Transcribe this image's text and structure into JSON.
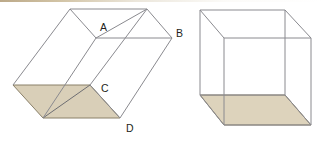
{
  "figure": {
    "background_color": "#ffffff",
    "edge_color": "#6e6e72",
    "shaded_face_color": "#d9cfb8",
    "shaded_face_stroke": "#8a8069",
    "label_color": "#231f20",
    "top_strip_color": "#b09a74"
  },
  "left_solid": {
    "name": "oblique-prism",
    "shaded_base_label": "shaded base parallelogram",
    "labels": [
      {
        "id": "A",
        "text": "A",
        "x": 100,
        "y": 31
      },
      {
        "id": "B",
        "text": "B",
        "x": 176,
        "y": 37
      },
      {
        "id": "C",
        "text": "C",
        "x": 101,
        "y": 92
      },
      {
        "id": "D",
        "text": "D",
        "x": 126,
        "y": 132
      }
    ],
    "geometry": {
      "top_back_left": [
        70,
        9
      ],
      "top_back_right": [
        147,
        9
      ],
      "top_front_right": [
        172,
        38
      ],
      "top_front_left": [
        96,
        38
      ],
      "bottom_back_left": [
        13,
        85
      ],
      "bottom_back_right": [
        90,
        85
      ],
      "bottom_front_right": [
        120,
        118
      ],
      "bottom_front_left": [
        43,
        118
      ]
    }
  },
  "right_solid": {
    "name": "right-cube",
    "shaded_base_label": "shaded base square",
    "geometry": {
      "top_back_left": [
        200,
        10
      ],
      "top_back_right": [
        285,
        10
      ],
      "top_front_right": [
        311,
        38
      ],
      "top_front_left": [
        224,
        38
      ],
      "bottom_back_left": [
        200,
        95
      ],
      "bottom_back_right": [
        285,
        95
      ],
      "bottom_front_right": [
        311,
        125
      ],
      "bottom_front_left": [
        224,
        125
      ]
    }
  }
}
